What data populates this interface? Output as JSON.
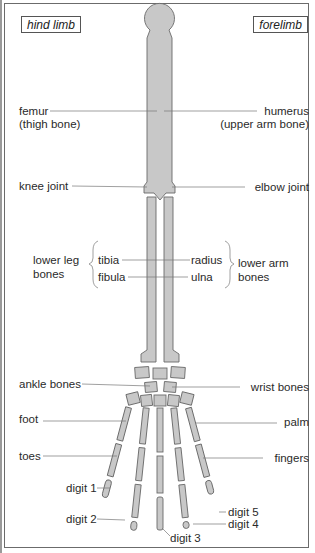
{
  "diagram": {
    "tags": {
      "left": "hind limb",
      "right": "forelimb"
    },
    "colors": {
      "bone_fill": "#c8c8c8",
      "bone_stroke": "#6a6a6a",
      "leader_line": "#777777",
      "text": "#2a2a2a",
      "frame": "#6b6b6b"
    },
    "labels_left": {
      "femur": "femur",
      "femur_sub": "(thigh bone)",
      "knee": "knee joint",
      "lower_leg_1": "lower leg",
      "lower_leg_2": "bones",
      "tibia": "tibia",
      "fibula": "fibula",
      "ankle": "ankle bones",
      "foot": "foot",
      "toes": "toes",
      "digit1": "digit 1",
      "digit2": "digit 2"
    },
    "labels_right": {
      "humerus": "humerus",
      "humerus_sub": "(upper arm bone)",
      "elbow": "elbow joint",
      "radius": "radius",
      "ulna": "ulna",
      "lower_arm_1": "lower arm",
      "lower_arm_2": "bones",
      "wrist": "wrist bones",
      "palm": "palm",
      "fingers": "fingers",
      "digit3": "digit 3",
      "digit4": "digit 4",
      "digit5": "digit 5"
    }
  }
}
